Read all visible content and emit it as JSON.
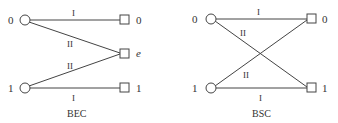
{
  "diagrams": [
    {
      "name": "BEC",
      "caption": "BEC",
      "inputs": [
        "0",
        "1"
      ],
      "outputs": [
        "0",
        "e",
        "1"
      ],
      "edges": [
        {
          "from": "0",
          "to": "0",
          "label": "I"
        },
        {
          "from": "0",
          "to": "e",
          "label": "II"
        },
        {
          "from": "1",
          "to": "e",
          "label": "II"
        },
        {
          "from": "1",
          "to": "1",
          "label": "I"
        }
      ]
    },
    {
      "name": "BSC",
      "caption": "BSC",
      "inputs": [
        "0",
        "1"
      ],
      "outputs": [
        "0",
        "1"
      ],
      "edges": [
        {
          "from": "0",
          "to": "0",
          "label": "I"
        },
        {
          "from": "0",
          "to": "1",
          "label": "II"
        },
        {
          "from": "1",
          "to": "0",
          "label": "II"
        },
        {
          "from": "1",
          "to": "1",
          "label": "I"
        }
      ]
    }
  ],
  "colors": {
    "stroke": "#444444",
    "text": "#333333"
  }
}
